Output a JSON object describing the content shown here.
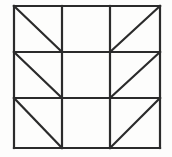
{
  "figure": {
    "kind": "line-drawing",
    "canvas": {
      "width": 172,
      "height": 157
    },
    "background_color": "#fdfdfc",
    "stroke_color": "#2b2b2b",
    "stroke_width": 2.2,
    "diagonal_stroke_width": 2.2,
    "grid": {
      "rows": 3,
      "columns": 3,
      "left": 14,
      "right": 160,
      "top": 6,
      "bottom": 148,
      "vertical_lines_x": [
        14,
        62,
        110,
        160
      ],
      "horizontal_lines_y": [
        6,
        52,
        98,
        148
      ]
    },
    "cells": [
      {
        "row": 0,
        "column": 0,
        "name": "top-left",
        "diagonal": "down-right",
        "x1": 14,
        "y1": 6,
        "x2": 62,
        "y2": 52
      },
      {
        "row": 0,
        "column": 1,
        "name": "top-middle",
        "diagonal": "none"
      },
      {
        "row": 0,
        "column": 2,
        "name": "top-right",
        "diagonal": "up-right",
        "x1": 110,
        "y1": 52,
        "x2": 160,
        "y2": 6
      },
      {
        "row": 1,
        "column": 0,
        "name": "middle-left",
        "diagonal": "down-right",
        "x1": 14,
        "y1": 52,
        "x2": 62,
        "y2": 98
      },
      {
        "row": 1,
        "column": 1,
        "name": "middle-middle",
        "diagonal": "none"
      },
      {
        "row": 1,
        "column": 2,
        "name": "middle-right",
        "diagonal": "up-right",
        "x1": 110,
        "y1": 98,
        "x2": 160,
        "y2": 52
      },
      {
        "row": 2,
        "column": 0,
        "name": "bottom-left",
        "diagonal": "down-right",
        "x1": 14,
        "y1": 98,
        "x2": 62,
        "y2": 148
      },
      {
        "row": 2,
        "column": 1,
        "name": "bottom-middle",
        "diagonal": "none"
      },
      {
        "row": 2,
        "column": 2,
        "name": "bottom-right",
        "diagonal": "up-right",
        "x1": 110,
        "y1": 148,
        "x2": 160,
        "y2": 98
      }
    ]
  }
}
